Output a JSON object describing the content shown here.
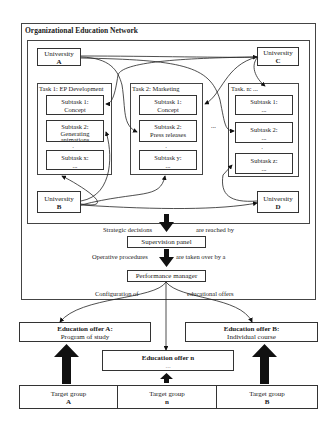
{
  "network": {
    "title": "Organizational Education Network",
    "universities": [
      {
        "label": "University",
        "id": "A"
      },
      {
        "label": "University",
        "id": "C"
      },
      {
        "label": "University",
        "id": "B"
      },
      {
        "label": "University",
        "id": "D"
      }
    ],
    "tasks": [
      {
        "title": "Task 1: EP Development",
        "subtasks": [
          {
            "line1": "Subtask 1:",
            "line2": "Concept"
          },
          {
            "line1": "Subtask 2:",
            "line2": "Generating animations"
          },
          {
            "line1": "Subtask x:",
            "line2": "..."
          }
        ]
      },
      {
        "title": "Task 2: Marketing",
        "subtasks": [
          {
            "line1": "Subtask 1:",
            "line2": "Concept"
          },
          {
            "line1": "Subtask 2:",
            "line2": "Press releases"
          },
          {
            "line1": "Subtask y:",
            "line2": "..."
          }
        ]
      },
      {
        "title": "Task. n: ...",
        "subtasks": [
          {
            "line1": "Subtask 1:",
            "line2": "..."
          },
          {
            "line1": "Subtask 2:",
            "line2": "..."
          },
          {
            "line1": "Subtask z:",
            "line2": "..."
          }
        ]
      }
    ],
    "ellipsis": "..."
  },
  "flow": {
    "strategic_left": "Strategic decisions",
    "strategic_right": "are reached by",
    "supervision_panel": "Supervision panel",
    "operative_left": "Operative procedures",
    "operative_right": "are taken over by a",
    "performance_manager": "Performance manager",
    "config_left": "Configuration of",
    "config_right": "educational offers"
  },
  "offers": {
    "a_title": "Education offer A:",
    "a_sub": "Program of study",
    "b_title": "Education offer B:",
    "b_sub": "Individual course",
    "n_title": "Education offer n",
    "n_sub": "..."
  },
  "target_groups": [
    {
      "label": "Target group",
      "id": "A"
    },
    {
      "label": "Target group",
      "id": "n"
    },
    {
      "label": "Target group",
      "id": "B"
    }
  ]
}
